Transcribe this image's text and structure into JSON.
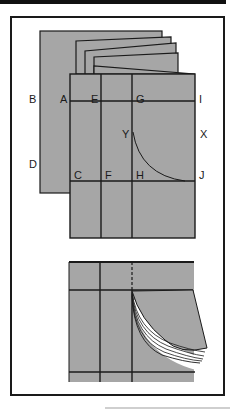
{
  "figure": {
    "type": "folded-paper-diagram",
    "colors": {
      "paper": "#a6a6a6",
      "line": "#1a1a1a",
      "background": "#ffffff"
    },
    "top_diagram": {
      "labels": {
        "B": "B",
        "A": "A",
        "E": "E",
        "G": "G",
        "I": "I",
        "Y": "Y",
        "X": "X",
        "D": "D",
        "C": "C",
        "F": "F",
        "H": "H",
        "J": "J"
      }
    },
    "bottom_diagram": {
      "description": "pages fanning out from cut"
    }
  }
}
